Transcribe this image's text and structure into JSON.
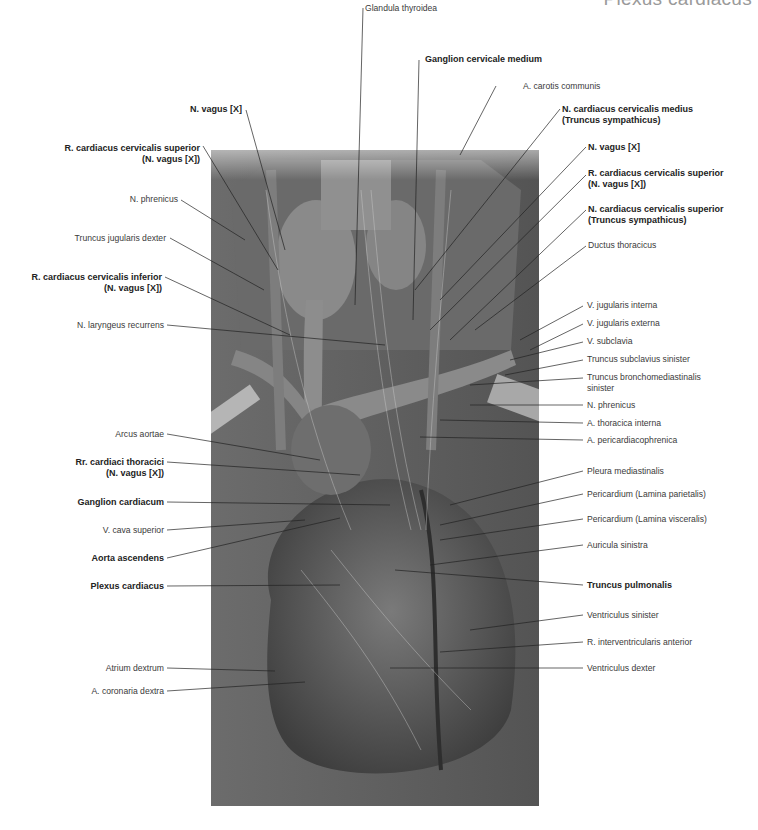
{
  "header": {
    "title": "Plexus cardiacus"
  },
  "figure": {
    "background": "#5e5e5e"
  },
  "labels_left": [
    {
      "text": "N. vagus [X]",
      "bold": true
    },
    {
      "text": "R. cardiacus cervicalis superior",
      "line2": "(N. vagus [X])",
      "bold": true
    },
    {
      "text": "N. phrenicus",
      "bold": false
    },
    {
      "text": "Truncus jugularis dexter",
      "bold": false
    },
    {
      "text": "R. cardiacus cervicalis inferior",
      "line2": "(N. vagus [X])",
      "bold": true
    },
    {
      "text": "N. laryngeus recurrens",
      "bold": false
    },
    {
      "text": "Arcus aortae",
      "bold": false
    },
    {
      "text": "Rr. cardiaci thoracici",
      "line2": "(N. vagus [X])",
      "bold": true
    },
    {
      "text": "Ganglion cardiacum",
      "bold": true
    },
    {
      "text": "V. cava superior",
      "bold": false
    },
    {
      "text": "Aorta ascendens",
      "bold": true
    },
    {
      "text": "Plexus cardiacus",
      "bold": true
    },
    {
      "text": "Atrium dextrum",
      "bold": false
    },
    {
      "text": "A. coronaria dextra",
      "bold": false
    }
  ],
  "labels_top": [
    {
      "text": "Glandula thyroidea",
      "bold": false
    },
    {
      "text": "Ganglion cervicale medium",
      "bold": true
    }
  ],
  "labels_right": [
    {
      "text": "A. carotis communis",
      "bold": false
    },
    {
      "text": "N. cardiacus cervicalis medius",
      "line2": "(Truncus sympathicus)",
      "bold": true
    },
    {
      "text": "N. vagus [X]",
      "bold": true
    },
    {
      "text": "R. cardiacus cervicalis superior",
      "line2": "(N. vagus [X])",
      "bold": true
    },
    {
      "text": "N. cardiacus cervicalis superior",
      "line2": "(Truncus sympathicus)",
      "bold": true
    },
    {
      "text": "Ductus thoracicus",
      "bold": false
    },
    {
      "text": "V. jugularis interna",
      "bold": false
    },
    {
      "text": "V. jugularis externa",
      "bold": false
    },
    {
      "text": "V. subclavia",
      "bold": false
    },
    {
      "text": "Truncus subclavius sinister",
      "bold": false
    },
    {
      "text": "Truncus bronchomediastinalis",
      "line2": "sinister",
      "bold": false
    },
    {
      "text": "N. phrenicus",
      "bold": false
    },
    {
      "text": "A. thoracica interna",
      "bold": false
    },
    {
      "text": "A. pericardiacophrenica",
      "bold": false
    },
    {
      "text": "Pleura mediastinalis",
      "bold": false
    },
    {
      "text": "Pericardium (Lamina parietalis)",
      "bold": false
    },
    {
      "text": "Pericardium (Lamina visceralis)",
      "bold": false
    },
    {
      "text": "Auricula sinistra",
      "bold": false
    },
    {
      "text": "Truncus pulmonalis",
      "bold": true
    },
    {
      "text": "Ventriculus sinister",
      "bold": false
    },
    {
      "text": "R. interventricularis anterior",
      "bold": false
    },
    {
      "text": "Ventriculus dexter",
      "bold": false
    }
  ]
}
